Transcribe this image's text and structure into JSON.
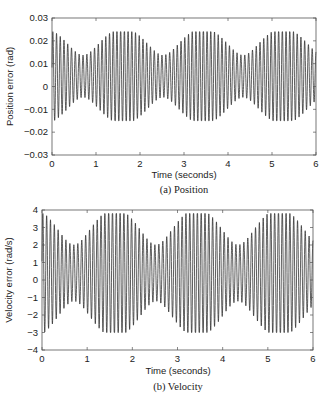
{
  "chart_data": [
    {
      "type": "line",
      "caption": "(a) Position",
      "title": "",
      "xlabel": "Time (seconds)",
      "ylabel": "Position error (rad)",
      "xlim": [
        0,
        6
      ],
      "ylim": [
        -0.03,
        0.03
      ],
      "xticks": [
        0,
        1,
        2,
        3,
        4,
        5,
        6
      ],
      "xtick_labels": [
        "0",
        "1",
        "2",
        "3",
        "4",
        "5",
        "6"
      ],
      "yticks": [
        -0.03,
        -0.02,
        -0.01,
        0,
        0.01,
        0.02,
        0.03
      ],
      "ytick_labels": [
        "-0.03",
        "-0.02",
        "-0.01",
        "0",
        "0.01",
        "0.02",
        "0.03"
      ],
      "grid": false,
      "series": [
        {
          "name": "position error",
          "description": "Sustained oscillation with ~11.7 cycles per second, peaks ~+0.024, troughs ~-0.015, with a slow beating envelope",
          "max": 0.024,
          "min": -0.015,
          "frequency_hz": 11.7,
          "beat_hz": 0.55
        }
      ],
      "frame": {
        "x0": 52,
        "y0": 18,
        "x1": 316,
        "y1": 155
      },
      "caption_pos": {
        "x": 184,
        "y": 193
      },
      "xlabel_pos": {
        "x": 184,
        "y": 178
      }
    },
    {
      "type": "line",
      "caption": "(b) Velocity",
      "title": "",
      "xlabel": "Time (seconds)",
      "ylabel": "Velocity error (rad/s)",
      "xlim": [
        0,
        6
      ],
      "ylim": [
        -4,
        4
      ],
      "xticks": [
        0,
        1,
        2,
        3,
        4,
        5,
        6
      ],
      "xtick_labels": [
        "0",
        "1",
        "2",
        "3",
        "4",
        "5",
        "6"
      ],
      "yticks": [
        -4,
        -3,
        -2,
        -1,
        0,
        1,
        2,
        3,
        4
      ],
      "ytick_labels": [
        "-4",
        "-3",
        "-2",
        "-1",
        "0",
        "1",
        "2",
        "3",
        "4"
      ],
      "grid": false,
      "series": [
        {
          "name": "velocity error",
          "description": "Sustained oscillation with ~11.7 cycles per second, peaks ~+3.8, troughs ~-3.0, with a slow beating envelope",
          "max": 3.8,
          "min": -3.0,
          "frequency_hz": 11.7,
          "beat_hz": 0.55
        }
      ],
      "frame": {
        "x0": 42,
        "y0": 210,
        "x1": 313,
        "y1": 350
      },
      "caption_pos": {
        "x": 178,
        "y": 390
      },
      "xlabel_pos": {
        "x": 178,
        "y": 374
      }
    }
  ]
}
